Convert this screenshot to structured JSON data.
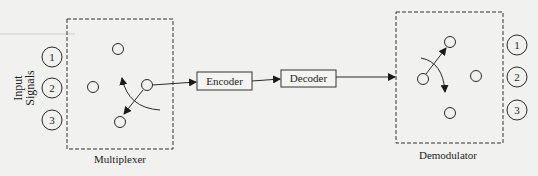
{
  "diagram": {
    "input_label_line1": "Input",
    "input_label_line2": "Signals",
    "inputs": [
      "1",
      "2",
      "3"
    ],
    "multiplexer_label": "Multiplexer",
    "encoder_label": "Encoder",
    "decoder_label": "Decoder",
    "demodulator_label": "Demodulator",
    "outputs": [
      "1",
      "2",
      "3"
    ],
    "colors": {
      "background": "#f1f1ef",
      "stroke": "#2a2a2a"
    }
  }
}
